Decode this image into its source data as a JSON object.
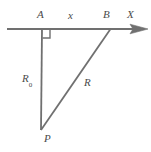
{
  "figure": {
    "type": "geometry-diagram",
    "background_color": "#ffffff",
    "stroke_color": "#707070",
    "label_color": "#4a4a4a",
    "width": 151,
    "height": 152
  },
  "labels": {
    "vertex_a": "A",
    "segment_x": "x",
    "vertex_b": "B",
    "axis_x": "X",
    "segment_r0_base": "R",
    "segment_r0_sub": "0",
    "segment_r": "R",
    "vertex_p": "P"
  },
  "geometry": {
    "axis_line": {
      "x1": 7,
      "y1": 29,
      "x2": 148,
      "y2": 29
    },
    "vertical_line": {
      "x1": 42,
      "y1": 29,
      "x2": 41,
      "y2": 130
    },
    "hypotenuse_line": {
      "x1": 41,
      "y1": 130,
      "x2": 110,
      "y2": 29
    },
    "right_angle_marker": {
      "x": 42,
      "y": 30,
      "size": 8
    },
    "arrow_head": {
      "tip_x": 148,
      "tip_y": 29,
      "back_x": 131,
      "half_height": 5
    },
    "points": {
      "A": {
        "x": 42,
        "y": 29
      },
      "B": {
        "x": 110,
        "y": 29
      },
      "P": {
        "x": 41,
        "y": 130
      }
    }
  }
}
